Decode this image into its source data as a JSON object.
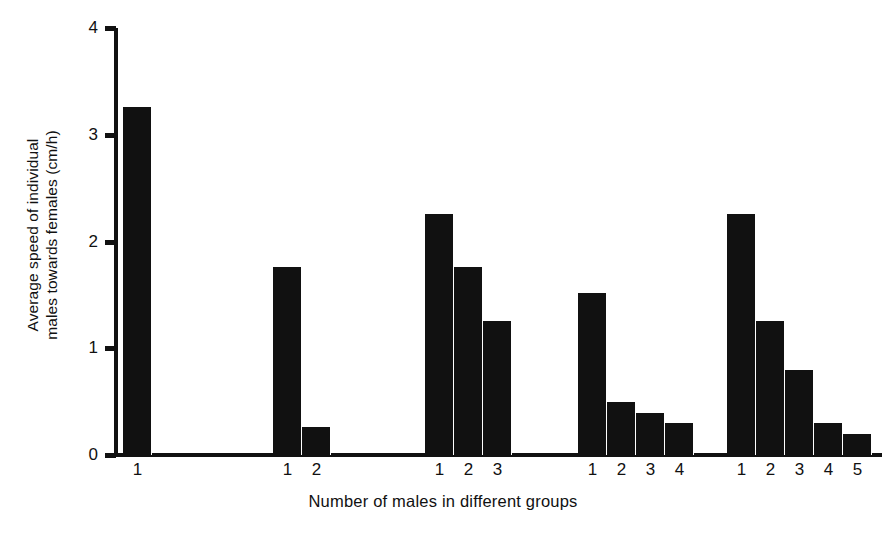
{
  "chart_data": {
    "type": "bar",
    "title": "",
    "xlabel": "Number of males in different groups",
    "ylabel": "Average speed of individual males towards females (cm/h)",
    "ylabel_lines": [
      "Average speed of individual",
      "males towards females (cm/h)"
    ],
    "ylim": [
      0,
      4
    ],
    "ytick_labels": [
      "0",
      "1",
      "2",
      "3",
      "4"
    ],
    "ytick_values": [
      0,
      1,
      2,
      3,
      4
    ],
    "grid": false,
    "legend": null,
    "bar_color": "#111111",
    "axis_color": "#111111",
    "groups": [
      {
        "group_label": "1",
        "categories": [
          "1"
        ],
        "values": [
          3.26
        ]
      },
      {
        "group_label": "2",
        "categories": [
          "1",
          "2"
        ],
        "values": [
          1.76,
          0.26
        ]
      },
      {
        "group_label": "3",
        "categories": [
          "1",
          "2",
          "3"
        ],
        "values": [
          2.26,
          1.76,
          1.26
        ]
      },
      {
        "group_label": "4",
        "categories": [
          "1",
          "2",
          "3",
          "4"
        ],
        "values": [
          1.52,
          0.5,
          0.39,
          0.3
        ]
      },
      {
        "group_label": "5",
        "categories": [
          "1",
          "2",
          "3",
          "4",
          "5"
        ],
        "values": [
          2.26,
          1.26,
          0.8,
          0.3,
          0.2
        ]
      }
    ],
    "categories": [
      "1",
      "1",
      "2",
      "1",
      "2",
      "3",
      "1",
      "2",
      "3",
      "4",
      "1",
      "2",
      "3",
      "4",
      "5"
    ],
    "values": [
      3.26,
      1.76,
      0.26,
      2.26,
      1.76,
      1.26,
      1.52,
      0.5,
      0.39,
      0.3,
      2.26,
      1.26,
      0.8,
      0.3,
      0.2
    ]
  },
  "layout": {
    "group_left_px": [
      5,
      155,
      307,
      460,
      609
    ],
    "bar_width_px": 29,
    "bar_gap_px": 0
  }
}
